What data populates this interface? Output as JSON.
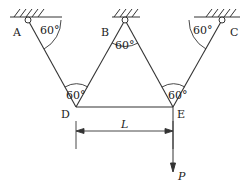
{
  "diagram": {
    "type": "truss-structure",
    "points": {
      "A": {
        "label": "A",
        "x": 28,
        "y": 20
      },
      "B": {
        "label": "B",
        "x": 125,
        "y": 20
      },
      "C": {
        "label": "C",
        "x": 222,
        "y": 20
      },
      "D": {
        "label": "D",
        "x": 76,
        "y": 107
      },
      "E": {
        "label": "E",
        "x": 173,
        "y": 107
      }
    },
    "members": [
      [
        "A",
        "D"
      ],
      [
        "B",
        "D"
      ],
      [
        "B",
        "E"
      ],
      [
        "C",
        "E"
      ],
      [
        "D",
        "E"
      ]
    ],
    "supports": [
      "A",
      "B",
      "C"
    ],
    "angles": {
      "at_A": "60°",
      "at_B": "60°",
      "at_C": "60°",
      "at_D": "60°",
      "at_E": "60°"
    },
    "dimension": {
      "label": "L",
      "from": "D",
      "to": "E"
    },
    "load": {
      "label": "P",
      "at": "E",
      "direction": "down"
    },
    "colors": {
      "line": "#333333",
      "background": "#ffffff"
    }
  }
}
